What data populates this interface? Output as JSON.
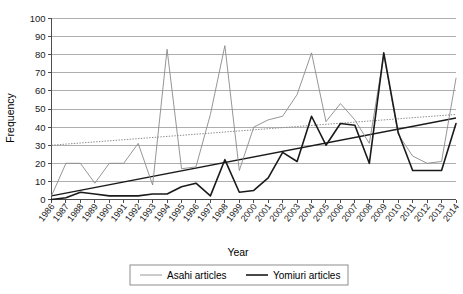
{
  "chart_data": {
    "type": "line",
    "title": "",
    "xlabel": "Year",
    "ylabel": "Frequency",
    "ylim": [
      0,
      100
    ],
    "ytick_step": 10,
    "yticks": [
      0,
      10,
      20,
      30,
      40,
      50,
      60,
      70,
      80,
      90,
      100
    ],
    "grid": true,
    "legend_position": "bottom",
    "categories": [
      "1986",
      "1987",
      "1988",
      "1989",
      "1990",
      "1991",
      "1992",
      "1993",
      "1994",
      "1995",
      "1996",
      "1997",
      "1998",
      "1999",
      "2000",
      "2001",
      "2002",
      "2003",
      "2004",
      "2005",
      "2006",
      "2007",
      "2008",
      "2009",
      "2010",
      "2011",
      "2012",
      "2013",
      "2014"
    ],
    "series": [
      {
        "name": "Asahi articles",
        "color": "#8a8a8a",
        "stroke_width": 0.9,
        "values": [
          2,
          20,
          20,
          9,
          20,
          20,
          31,
          8,
          83,
          17,
          18,
          47,
          85,
          16,
          40,
          44,
          46,
          58,
          81,
          43,
          53,
          44,
          31,
          80,
          36,
          24,
          20,
          21,
          67
        ]
      },
      {
        "name": "Yomiuri articles",
        "color": "#1a1a1a",
        "stroke_width": 1.6,
        "values": [
          0,
          1,
          4,
          3,
          2,
          2,
          2,
          3,
          3,
          7,
          9,
          2,
          22,
          4,
          5,
          12,
          26,
          21,
          46,
          30,
          42,
          41,
          20,
          81,
          37,
          16,
          16,
          16,
          42
        ]
      }
    ],
    "trendlines": [
      {
        "name": "Asahi trendline",
        "style": "dotted",
        "color": "#8a8a8a",
        "start_value": 30,
        "end_value": 47
      },
      {
        "name": "Yomiuri trendline",
        "style": "solid",
        "color": "#1a1a1a",
        "start_value": 2,
        "end_value": 45
      }
    ]
  },
  "legend": {
    "items": [
      {
        "label": "Asahi articles"
      },
      {
        "label": "Yomiuri articles"
      }
    ]
  },
  "axes": {
    "y_title": "Frequency",
    "x_title": "Year"
  }
}
